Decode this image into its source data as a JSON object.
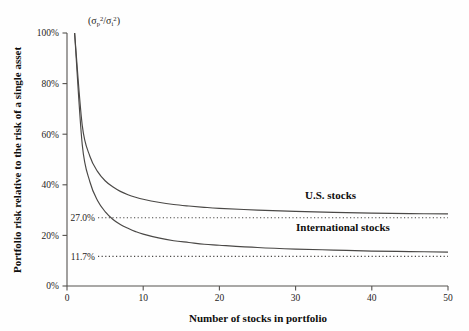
{
  "chart_data": {
    "type": "line",
    "title": "",
    "unit_label": "(σp²/σi²)",
    "xlabel": "Number of stocks in portfolio",
    "ylabel": "Portfolio risk relative to the risk of a single asset",
    "xlim": [
      0,
      50
    ],
    "ylim": [
      0,
      100
    ],
    "grid": false,
    "legend_position": "inline-right",
    "xticks": [
      "0",
      "10",
      "20",
      "30",
      "40",
      "50"
    ],
    "xtick_values": [
      0,
      10,
      20,
      30,
      40,
      50
    ],
    "yticks": [
      "0%",
      "20%",
      "40%",
      "60%",
      "80%",
      "100%"
    ],
    "ytick_values": [
      0,
      20,
      40,
      60,
      80,
      100
    ],
    "x": [
      1,
      2,
      3,
      4,
      5,
      6,
      7,
      8,
      9,
      10,
      12,
      14,
      16,
      18,
      20,
      25,
      30,
      35,
      40,
      45,
      50
    ],
    "series": [
      {
        "name": "U.S. stocks",
        "label": "U.S. stocks",
        "asymptote": 27.0,
        "asymptote_label": "27.0%",
        "color": "#4a4846",
        "values": [
          100.0,
          63.5,
          51.3,
          45.3,
          41.6,
          39.2,
          37.4,
          36.1,
          35.1,
          34.3,
          33.1,
          32.2,
          31.6,
          31.1,
          30.7,
          30.0,
          29.5,
          29.1,
          28.8,
          28.6,
          28.5
        ]
      },
      {
        "name": "International stocks",
        "label": "International stocks",
        "asymptote": 11.7,
        "asymptote_label": "11.7%",
        "color": "#4a4846",
        "values": [
          100.0,
          55.9,
          41.2,
          33.8,
          29.4,
          26.4,
          24.3,
          22.8,
          21.5,
          20.5,
          19.0,
          17.9,
          17.2,
          16.5,
          16.1,
          15.2,
          14.6,
          14.2,
          13.8,
          13.6,
          13.4
        ]
      }
    ],
    "annotations": [
      {
        "text": "27.0%",
        "type": "asymptote-label",
        "value": 27.0
      },
      {
        "text": "11.7%",
        "type": "asymptote-label",
        "value": 11.7
      }
    ]
  }
}
